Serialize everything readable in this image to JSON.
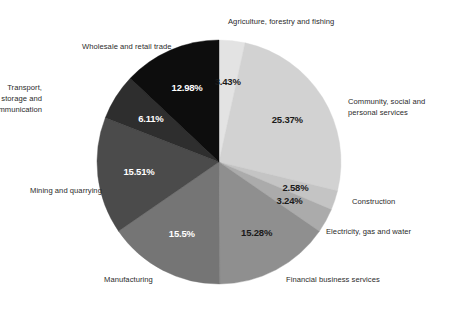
{
  "chart_data": {
    "type": "pie",
    "title": "",
    "subtitle": "",
    "xlabel": "",
    "ylabel": "",
    "legend_position": "none",
    "grid": false,
    "units": "percent",
    "start_angle_deg": 0,
    "direction": "clockwise",
    "categories": [
      "Agriculture, forestry and fishing",
      "Community, social and personal services",
      "Construction",
      "Electricity, gas and water",
      "Financial business services",
      "Manufacturing",
      "Mining and quarrying",
      "Transport, storage and communication",
      "Wholesale and retail trade"
    ],
    "values": [
      3.43,
      25.37,
      2.58,
      3.24,
      15.28,
      15.5,
      15.51,
      6.11,
      12.98
    ],
    "value_labels": [
      "3.43%",
      "25.37%",
      "2.58%",
      "3.24%",
      "15.28%",
      "15.5%",
      "15.51%",
      "6.11%",
      "12.98%"
    ],
    "colors": [
      "#e3e3e3",
      "#d2d2d2",
      "#c4c4c4",
      "#ababab",
      "#8f8f8f",
      "#757575",
      "#4b4b4b",
      "#2e2e2e",
      "#0d0d0d"
    ],
    "slices": [
      {
        "label": "Agriculture, forestry and fishing",
        "value": 3.43,
        "value_label": "3.43%",
        "color": "#e3e3e3",
        "value_text_color": "#1a1a1a",
        "label_lines": "Agriculture, forestry and fishing"
      },
      {
        "label": "Community, social and personal services",
        "value": 25.37,
        "value_label": "25.37%",
        "color": "#d2d2d2",
        "value_text_color": "#1a1a1a",
        "label_lines": "Community, social and\npersonal services"
      },
      {
        "label": "Construction",
        "value": 2.58,
        "value_label": "2.58%",
        "color": "#c4c4c4",
        "value_text_color": "#1a1a1a",
        "label_lines": "Construction"
      },
      {
        "label": "Electricity, gas and water",
        "value": 3.24,
        "value_label": "3.24%",
        "color": "#ababab",
        "value_text_color": "#1a1a1a",
        "label_lines": "Electricity, gas and water"
      },
      {
        "label": "Financial business services",
        "value": 15.28,
        "value_label": "15.28%",
        "color": "#8f8f8f",
        "value_text_color": "#1a1a1a",
        "label_lines": "Financial business services"
      },
      {
        "label": "Manufacturing",
        "value": 15.5,
        "value_label": "15.5%",
        "color": "#757575",
        "value_text_color": "#ffffff",
        "label_lines": "Manufacturing"
      },
      {
        "label": "Mining and quarrying",
        "value": 15.51,
        "value_label": "15.51%",
        "color": "#4b4b4b",
        "value_text_color": "#ffffff",
        "label_lines": "Mining and quarrying"
      },
      {
        "label": "Transport, storage and communication",
        "value": 6.11,
        "value_label": "6.11%",
        "color": "#2e2e2e",
        "value_text_color": "#ffffff",
        "label_lines": "Transport, storage and\ncommunication"
      },
      {
        "label": "Wholesale and retail trade",
        "value": 12.98,
        "value_label": "12.98%",
        "color": "#0d0d0d",
        "value_text_color": "#ffffff",
        "label_lines": "Wholesale and retail trade"
      }
    ],
    "geometry": {
      "center_x": 219,
      "center_y": 162,
      "radius": 122,
      "value_label_radius_factor": 0.66
    },
    "label_positions": [
      {
        "key": "Agriculture, forestry and fishing",
        "x": 228,
        "y": 16,
        "align": "left"
      },
      {
        "key": "Community, social and personal services",
        "x": 348,
        "y": 96,
        "align": "left"
      },
      {
        "key": "Construction",
        "x": 352,
        "y": 196,
        "align": "left"
      },
      {
        "key": "Electricity, gas and water",
        "x": 326,
        "y": 226,
        "align": "left"
      },
      {
        "key": "Financial business services",
        "x": 286,
        "y": 274,
        "align": "left"
      },
      {
        "key": "Manufacturing",
        "x": 104,
        "y": 274,
        "align": "left"
      },
      {
        "key": "Mining and quarrying",
        "x": 30,
        "y": 185,
        "align": "left"
      },
      {
        "key": "Transport, storage and communication",
        "x": 42,
        "y": 82,
        "align": "right"
      },
      {
        "key": "Wholesale and retail trade",
        "x": 82,
        "y": 41,
        "align": "left"
      }
    ]
  }
}
